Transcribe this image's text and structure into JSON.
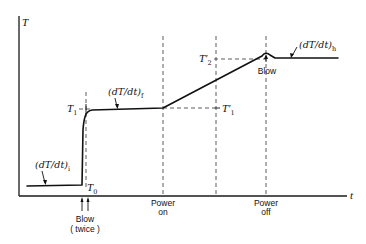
{
  "diagram": {
    "axes": {
      "y_label": "T",
      "x_label": "t"
    },
    "temperature_labels": {
      "T0": {
        "main": "T",
        "sub": "0"
      },
      "T1": {
        "main": "T",
        "sub": "1"
      },
      "T1_prime": {
        "main": "T′",
        "sub": "1"
      },
      "T2_prime": {
        "main": "T′",
        "sub": "2"
      }
    },
    "slope_labels": {
      "initial": {
        "main": "(dT/dt)",
        "sub": "i"
      },
      "final": {
        "main": "(dT/dt)",
        "sub": "f"
      },
      "heating": {
        "main": "(dT/dt)",
        "sub": "h"
      }
    },
    "event_labels": {
      "blow_twice_line1": "Blow",
      "blow_twice_line2": "( twice )",
      "power_on_line1": "Power",
      "power_on_line2": "on",
      "power_off_line1": "Power",
      "power_off_line2": "off",
      "blow_peak": "Blow"
    },
    "colors": {
      "line": "#111111",
      "background": "#ffffff"
    }
  }
}
